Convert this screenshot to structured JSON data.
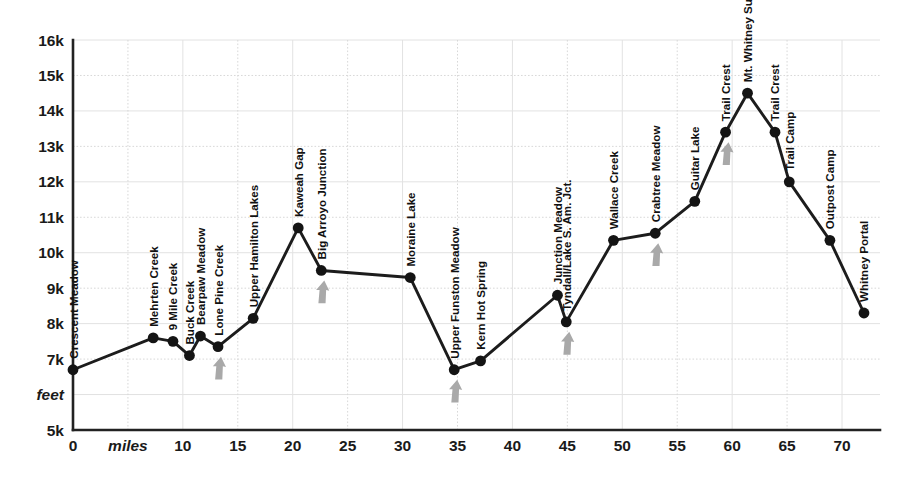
{
  "chart_data": {
    "type": "line",
    "title": "",
    "subtitle": "",
    "xlabel": "miles",
    "ylabel": "feet",
    "xlim": [
      0,
      72.8
    ],
    "ylim": [
      5000,
      16000
    ],
    "grid": true,
    "legend": "none",
    "x_ticks": [
      "0",
      "miles",
      "10",
      "15",
      "20",
      "25",
      "30",
      "35",
      "40",
      "45",
      "50",
      "55",
      "60",
      "65",
      "70"
    ],
    "x_tick_values": [
      0,
      5,
      10,
      15,
      20,
      25,
      30,
      35,
      40,
      45,
      50,
      55,
      60,
      65,
      70
    ],
    "y_ticks": [
      "5k",
      "feet",
      "7k",
      "8k",
      "9k",
      "10k",
      "11k",
      "12k",
      "13k",
      "14k",
      "15k",
      "16k"
    ],
    "y_tick_values": [
      5000,
      6000,
      7000,
      8000,
      9000,
      10000,
      11000,
      12000,
      13000,
      14000,
      15000,
      16000
    ],
    "point_labels": [
      "Crescent Meadow",
      "Mehrten Creek",
      "9 Mile Creek",
      "Buck Creek",
      "Bearpaw Meadow",
      "Lone Pine Creek",
      "Upper Hamilton Lakes",
      "Kaweah Gap",
      "Big Arroyo Junction",
      "Moraine Lake",
      "Upper Funston Meadow",
      "Kern Hot Spring",
      "Junction Meadow",
      "Tyndall/Lake S. Am. Jct.",
      "Wallace Creek",
      "Crabtree Meadow",
      "Guitar Lake",
      "Trail Crest",
      "Mt. Whitney Summit",
      "Trail Crest",
      "Trail Camp",
      "Outpost Camp",
      "Whitney Portal"
    ],
    "x": [
      0,
      7.3,
      9.1,
      10.6,
      11.6,
      13.2,
      16.4,
      20.5,
      22.6,
      30.7,
      34.7,
      37.1,
      44.1,
      44.9,
      49.2,
      53.0,
      56.6,
      59.4,
      61.4,
      63.9,
      65.2,
      68.9,
      72.0
    ],
    "values": [
      6700,
      7600,
      7500,
      7100,
      7650,
      7350,
      8150,
      10700,
      9500,
      9300,
      6700,
      6950,
      8800,
      8050,
      10350,
      10550,
      11450,
      13400,
      14500,
      13400,
      12000,
      10350,
      8300
    ],
    "markers": [
      {
        "label": "Lone Pine Creek",
        "x": 13.2,
        "y": 7350
      },
      {
        "label": "Big Arroyo Junction",
        "x": 22.6,
        "y": 9500
      },
      {
        "label": "Upper Funston Meadow",
        "x": 34.7,
        "y": 6700
      },
      {
        "label": "Tyndall/Lake S. Am. Jct.",
        "x": 44.9,
        "y": 8050
      },
      {
        "label": "Crabtree Meadow",
        "x": 53.0,
        "y": 10550
      },
      {
        "label": "Trail Crest",
        "x": 59.4,
        "y": 13400
      }
    ],
    "colors": {
      "line": "#1c1c1c",
      "marker": "#141414",
      "arrow": "#a9a9a9",
      "grid": "#d8d8d8",
      "axis": "#222222",
      "background": "#ffffff"
    }
  }
}
